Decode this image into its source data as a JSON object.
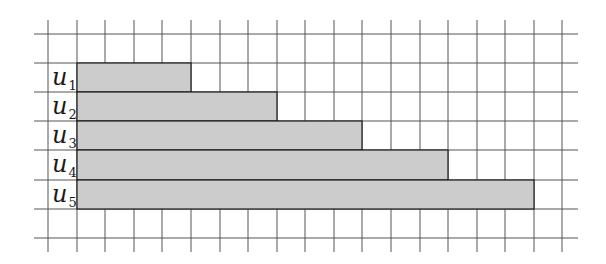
{
  "diagram": {
    "type": "grid-bar-diagram",
    "colors": {
      "background": "#ffffff",
      "grid_line": "#555555",
      "bar_fill": "#cccccc",
      "bar_stroke": "#1a1a1a",
      "label": "#1a1a1a"
    },
    "grid": {
      "columns": 19,
      "rows": 8,
      "cell_width": 28.55,
      "cell_height": 29.2
    },
    "bars": [
      {
        "label_base": "u",
        "label_sub": "1",
        "start_cell": 1,
        "length_cells": 4
      },
      {
        "label_base": "u",
        "label_sub": "2",
        "start_cell": 1,
        "length_cells": 7
      },
      {
        "label_base": "u",
        "label_sub": "3",
        "start_cell": 1,
        "length_cells": 10
      },
      {
        "label_base": "u",
        "label_sub": "4",
        "start_cell": 1,
        "length_cells": 13
      },
      {
        "label_base": "u",
        "label_sub": "5",
        "start_cell": 1,
        "length_cells": 16
      }
    ]
  }
}
